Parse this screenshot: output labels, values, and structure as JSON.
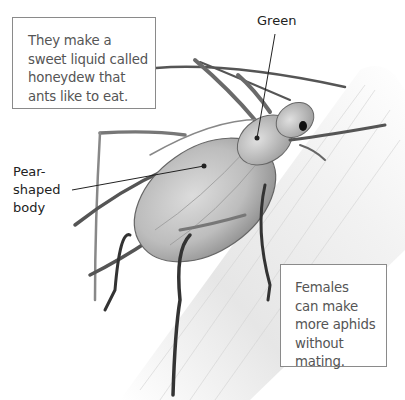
{
  "figure": {
    "subject": "aphid"
  },
  "labels": {
    "green": "Green",
    "pear_shaped_body": [
      "Pear-",
      "shaped",
      "body"
    ]
  },
  "callouts": {
    "honeydew": [
      "They make a",
      "sweet liquid called",
      "honeydew that",
      "ants like to eat."
    ],
    "females": [
      "Females",
      "can make",
      "more aphids",
      "without",
      "mating."
    ]
  },
  "colors": {
    "box_border": "#8a8a8a",
    "box_text": "#555555",
    "label_text": "#222222",
    "stem": "#e4e4e4",
    "body": "#c9c9c9"
  }
}
